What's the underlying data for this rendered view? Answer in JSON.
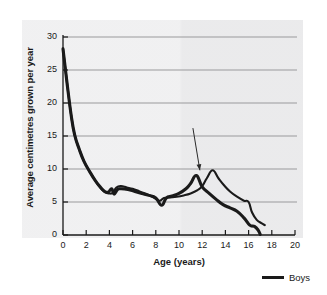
{
  "chart_data": {
    "type": "line",
    "title": "",
    "xlabel": "Age (years)",
    "ylabel": "Average centimetres grown per year",
    "xlim": [
      0,
      20
    ],
    "ylim": [
      0,
      30
    ],
    "xticks": [
      0,
      2,
      4,
      6,
      8,
      10,
      12,
      14,
      16,
      18,
      20
    ],
    "yticks": [
      0,
      5,
      10,
      15,
      20,
      25,
      30
    ],
    "grid": "horizontal",
    "legend_position": "bottom-right",
    "series": [
      {
        "name": "Girls",
        "color": "#1a1a1a",
        "points": [
          [
            0.0,
            28.2
          ],
          [
            0.35,
            23.0
          ],
          [
            0.7,
            18.2
          ],
          [
            1.0,
            15.2
          ],
          [
            1.4,
            13.0
          ],
          [
            1.8,
            11.2
          ],
          [
            2.3,
            9.6
          ],
          [
            2.8,
            8.2
          ],
          [
            3.2,
            7.3
          ],
          [
            3.6,
            6.6
          ],
          [
            3.9,
            6.5
          ],
          [
            4.2,
            7.0
          ],
          [
            4.4,
            6.2
          ],
          [
            4.7,
            6.9
          ],
          [
            5.0,
            7.0
          ],
          [
            5.6,
            6.9
          ],
          [
            6.2,
            6.6
          ],
          [
            6.8,
            6.3
          ],
          [
            7.4,
            6.0
          ],
          [
            8.0,
            5.6
          ],
          [
            8.5,
            4.5
          ],
          [
            8.9,
            5.6
          ],
          [
            9.4,
            5.9
          ],
          [
            10.0,
            6.3
          ],
          [
            10.6,
            7.0
          ],
          [
            11.0,
            7.8
          ],
          [
            11.5,
            9.0
          ],
          [
            12.0,
            7.3
          ],
          [
            12.6,
            6.3
          ],
          [
            13.2,
            5.4
          ],
          [
            13.8,
            4.6
          ],
          [
            14.4,
            4.1
          ],
          [
            15.0,
            3.6
          ],
          [
            15.6,
            2.6
          ],
          [
            16.1,
            1.5
          ],
          [
            16.5,
            1.3
          ],
          [
            16.8,
            0.8
          ],
          [
            17.0,
            0.1
          ]
        ]
      },
      {
        "name": "Boys",
        "color": "#1a1a1a",
        "points": [
          [
            0.0,
            28.2
          ],
          [
            0.35,
            23.0
          ],
          [
            0.7,
            18.2
          ],
          [
            1.0,
            15.2
          ],
          [
            1.4,
            13.0
          ],
          [
            1.8,
            11.2
          ],
          [
            2.3,
            9.6
          ],
          [
            2.8,
            8.2
          ],
          [
            3.2,
            7.2
          ],
          [
            3.6,
            6.5
          ],
          [
            4.0,
            6.3
          ],
          [
            4.3,
            6.4
          ],
          [
            4.6,
            7.2
          ],
          [
            5.0,
            7.4
          ],
          [
            5.5,
            7.2
          ],
          [
            6.0,
            7.0
          ],
          [
            6.6,
            6.6
          ],
          [
            7.2,
            6.2
          ],
          [
            7.8,
            5.7
          ],
          [
            8.3,
            5.2
          ],
          [
            8.7,
            5.6
          ],
          [
            9.2,
            5.7
          ],
          [
            9.8,
            5.8
          ],
          [
            10.4,
            6.0
          ],
          [
            11.0,
            6.3
          ],
          [
            11.6,
            6.8
          ],
          [
            12.0,
            7.4
          ],
          [
            12.4,
            8.6
          ],
          [
            12.9,
            9.8
          ],
          [
            13.4,
            8.6
          ],
          [
            13.9,
            7.5
          ],
          [
            14.4,
            6.6
          ],
          [
            15.0,
            5.8
          ],
          [
            15.6,
            5.2
          ],
          [
            16.0,
            5.0
          ],
          [
            16.3,
            3.4
          ],
          [
            16.7,
            2.3
          ],
          [
            17.1,
            1.8
          ],
          [
            17.4,
            1.5
          ]
        ]
      }
    ],
    "annotations": [
      {
        "type": "arrow",
        "name": "growth-spurt-arrow",
        "from": [
          11.2,
          16.2
        ],
        "to": [
          11.8,
          9.8
        ],
        "label": ""
      }
    ],
    "legend": [
      {
        "label": "Boys",
        "color": "#1a1a1a"
      }
    ]
  },
  "colors": {
    "panel_background": "#ececed",
    "gridline": "#9a9a9c",
    "axis": "#1a1a1a",
    "line": "#1a1a1a"
  }
}
